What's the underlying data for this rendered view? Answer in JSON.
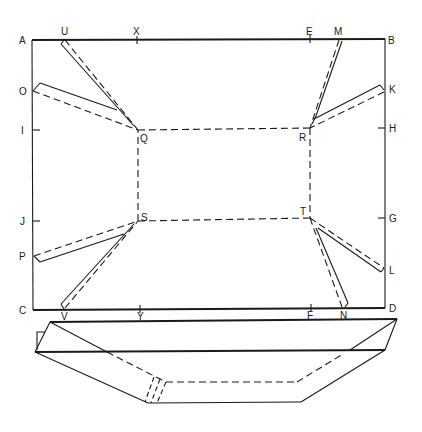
{
  "figure": {
    "colors": {
      "ink": "#1a1a1a",
      "paper": "#ffffff"
    }
  },
  "labels": {
    "A": "A",
    "B": "B",
    "C": "C",
    "D": "D",
    "U": "U",
    "X": "X",
    "E": "E",
    "M": "M",
    "O": "O",
    "I": "I",
    "J": "J",
    "P": "P",
    "K": "K",
    "H": "H",
    "G": "G",
    "L": "L",
    "V": "V",
    "Y": "Y",
    "F": "F",
    "N": "N",
    "Q": "Q",
    "R": "R",
    "S": "S",
    "T": "T"
  },
  "points": {
    "A": [
      32,
      40
    ],
    "B": [
      385,
      39
    ],
    "C": [
      33,
      310
    ],
    "D": [
      385,
      308
    ],
    "U": [
      62,
      40
    ],
    "X": [
      137,
      40
    ],
    "E": [
      310,
      39
    ],
    "M": [
      340,
      39
    ],
    "O": [
      33,
      91
    ],
    "I": [
      33,
      130
    ],
    "J": [
      33,
      221
    ],
    "P": [
      34,
      256
    ],
    "K": [
      384,
      89
    ],
    "H": [
      385,
      128
    ],
    "G": [
      385,
      218
    ],
    "L": [
      384,
      270
    ],
    "V": [
      62,
      309
    ],
    "Y": [
      140,
      309
    ],
    "F": [
      311,
      308
    ],
    "N": [
      345,
      307
    ],
    "Q": [
      138,
      130
    ],
    "R": [
      310,
      128
    ],
    "S": [
      138,
      221
    ],
    "T": [
      310,
      218
    ]
  },
  "edges": {
    "outer_rectangle": [
      "A",
      "B",
      "D",
      "C"
    ],
    "fold_rectangle_dashed": [
      "Q",
      "R",
      "T",
      "S"
    ],
    "gusset_pairs": [
      [
        "U",
        "Q",
        "O"
      ],
      [
        "M",
        "R",
        "K"
      ],
      [
        "P",
        "S",
        "V"
      ],
      [
        "L",
        "T",
        "N"
      ]
    ]
  },
  "tray_view": {
    "top_left": [
      50,
      322
    ],
    "top_right": [
      397,
      319
    ],
    "rim_left": [
      35,
      352
    ],
    "rim_right": [
      385,
      350
    ],
    "base_left": [
      148,
      403
    ],
    "base_right": [
      301,
      402
    ],
    "inner_base_left": [
      166,
      382
    ],
    "inner_base_right": [
      297,
      382
    ]
  }
}
